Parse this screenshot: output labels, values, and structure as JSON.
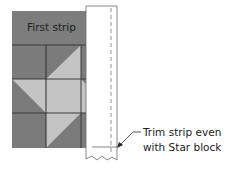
{
  "diagram": {
    "block": {
      "first_strip_label": "First strip",
      "colors": {
        "dark": "#7b7b7b",
        "light": "#c4c4c4",
        "strip": "#7d7d7d",
        "seam": "#3a3a3a"
      }
    },
    "strip": {
      "fill": "#ffffff",
      "outline": "#6a6a6a",
      "stitch_line": "dashed"
    },
    "callout": {
      "line1": "Trim strip even",
      "line2": "with Star block"
    }
  }
}
